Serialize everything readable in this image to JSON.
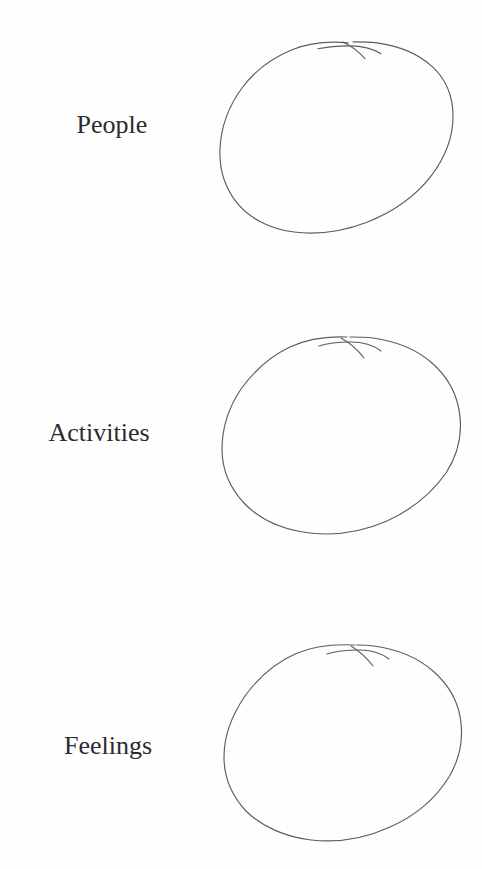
{
  "page": {
    "background_color": "#fefefe",
    "ink_color": "#5c5c62",
    "text_color": "#2b2b30",
    "width": 482,
    "height": 869
  },
  "rows": [
    {
      "label": "People",
      "shape": "hand-drawn-circle",
      "shape_note": "empty hand-drawn circle with overlapping pen start/end stroke at top right",
      "label_center_x": 112,
      "label_center_y": 127,
      "circle": {
        "x": 217,
        "y": 38,
        "width": 240,
        "height": 196
      }
    },
    {
      "label": "Activities",
      "shape": "hand-drawn-circle",
      "shape_note": "empty hand-drawn circle with overlapping pen start/end stroke at top right",
      "label_center_x": 99,
      "label_center_y": 435,
      "circle": {
        "x": 219,
        "y": 332,
        "width": 242,
        "height": 204
      }
    },
    {
      "label": "Feelings",
      "shape": "hand-drawn-circle",
      "shape_note": "empty hand-drawn circle with overlapping pen start/end stroke at top right",
      "label_center_x": 108,
      "label_center_y": 748,
      "circle": {
        "x": 221,
        "y": 641,
        "width": 242,
        "height": 201
      }
    }
  ]
}
